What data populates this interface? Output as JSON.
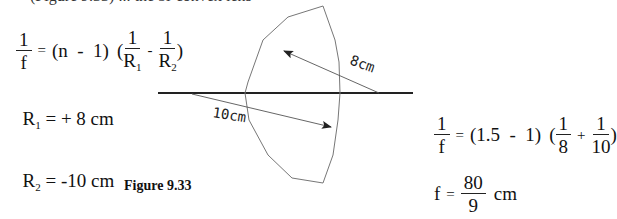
{
  "top_cutoff_text": "(Figure 9.33) ... the bi-convex lens",
  "lens_maker_formula": {
    "lhs": {
      "num": "1",
      "den": "f"
    },
    "equals": "=",
    "factor": "(n  -  1)",
    "open": "(",
    "term1": {
      "num": "1",
      "den": "R",
      "sub": "1"
    },
    "minus": "-",
    "term2": {
      "num": "1",
      "den": "R",
      "sub": "2"
    },
    "close": ")"
  },
  "r1": {
    "label": "R",
    "sub": "1",
    "value": " = + 8 cm"
  },
  "r2": {
    "label": "R",
    "sub": "2",
    "value": " = -10 cm"
  },
  "figure_caption": "Figure 9.33",
  "diagram": {
    "label_8cm": "8cm",
    "label_10cm": "10cm"
  },
  "substituted_formula": {
    "lhs": {
      "num": "1",
      "den": "f"
    },
    "equals": "=",
    "factor": "(1.5  -  1)",
    "open": "(",
    "term1": {
      "num": "1",
      "den": "8"
    },
    "plus": "+",
    "term2": {
      "num": "1",
      "den": "10"
    },
    "close": ")"
  },
  "result": {
    "lhs": "f",
    "equals": "=",
    "value": {
      "num": "80",
      "den": "9"
    },
    "unit": "cm"
  }
}
